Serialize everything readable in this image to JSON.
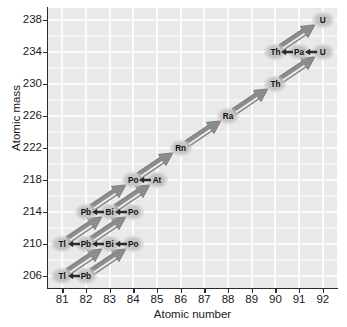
{
  "chart_data": {
    "type": "scatter",
    "title": "",
    "xlabel": "Atomic number",
    "ylabel": "Atomic mass",
    "xlim": [
      80.4,
      92.6
    ],
    "ylim": [
      204.5,
      239.5
    ],
    "xticks": [
      81,
      82,
      83,
      84,
      85,
      86,
      87,
      88,
      89,
      90,
      91,
      92
    ],
    "yticks": [
      206,
      210,
      214,
      218,
      222,
      226,
      230,
      234,
      238
    ],
    "grid": true,
    "legend": "none",
    "nodes": [
      {
        "label": "U",
        "z": 92,
        "a": 238
      },
      {
        "label": "Th",
        "z": 90,
        "a": 234
      },
      {
        "label": "Pa",
        "z": 91,
        "a": 234
      },
      {
        "label": "U",
        "z": 92,
        "a": 234
      },
      {
        "label": "Th",
        "z": 90,
        "a": 230
      },
      {
        "label": "Ra",
        "z": 88,
        "a": 226
      },
      {
        "label": "Rn",
        "z": 86,
        "a": 222
      },
      {
        "label": "Po",
        "z": 84,
        "a": 218
      },
      {
        "label": "At",
        "z": 85,
        "a": 218
      },
      {
        "label": "Pb",
        "z": 82,
        "a": 214
      },
      {
        "label": "Bi",
        "z": 83,
        "a": 214
      },
      {
        "label": "Po",
        "z": 84,
        "a": 214
      },
      {
        "label": "Tl",
        "z": 81,
        "a": 210
      },
      {
        "label": "Pb",
        "z": 82,
        "a": 210
      },
      {
        "label": "Bi",
        "z": 83,
        "a": 210
      },
      {
        "label": "Po",
        "z": 84,
        "a": 210
      },
      {
        "label": "Tl",
        "z": 81,
        "a": 206
      },
      {
        "label": "Pb",
        "z": 82,
        "a": 206
      }
    ],
    "alpha_decays": [
      {
        "from_z": 92,
        "from_a": 238,
        "to_z": 90,
        "to_a": 234
      },
      {
        "from_z": 92,
        "from_a": 234,
        "to_z": 90,
        "to_a": 230
      },
      {
        "from_z": 90,
        "from_a": 230,
        "to_z": 88,
        "to_a": 226
      },
      {
        "from_z": 88,
        "from_a": 226,
        "to_z": 86,
        "to_a": 222
      },
      {
        "from_z": 86,
        "from_a": 222,
        "to_z": 84,
        "to_a": 218
      },
      {
        "from_z": 84,
        "from_a": 218,
        "to_z": 82,
        "to_a": 214
      },
      {
        "from_z": 85,
        "from_a": 218,
        "to_z": 83,
        "to_a": 214
      },
      {
        "from_z": 84,
        "from_a": 214,
        "to_z": 82,
        "to_a": 210
      },
      {
        "from_z": 83,
        "from_a": 214,
        "to_z": 81,
        "to_a": 210
      },
      {
        "from_z": 84,
        "from_a": 210,
        "to_z": 82,
        "to_a": 206
      },
      {
        "from_z": 83,
        "from_a": 210,
        "to_z": 81,
        "to_a": 206
      }
    ],
    "beta_decays": [
      {
        "from_z": 91,
        "from_a": 234,
        "to_z": 90,
        "to_a": 234
      },
      {
        "from_z": 92,
        "from_a": 234,
        "to_z": 91,
        "to_a": 234
      },
      {
        "from_z": 85,
        "from_a": 218,
        "to_z": 84,
        "to_a": 218
      },
      {
        "from_z": 83,
        "from_a": 214,
        "to_z": 82,
        "to_a": 214
      },
      {
        "from_z": 84,
        "from_a": 214,
        "to_z": 83,
        "to_a": 214
      },
      {
        "from_z": 82,
        "from_a": 210,
        "to_z": 81,
        "to_a": 210
      },
      {
        "from_z": 83,
        "from_a": 210,
        "to_z": 82,
        "to_a": 210
      },
      {
        "from_z": 84,
        "from_a": 210,
        "to_z": 83,
        "to_a": 210
      },
      {
        "from_z": 82,
        "from_a": 206,
        "to_z": 81,
        "to_a": 206
      }
    ],
    "colors": {
      "plot_background": "#e9e9e9",
      "gridline": "#fbfbfb",
      "axis": "#2b2b2b",
      "alpha_arrow": "#8c8c8c",
      "alpha_arrow_highlight": "#f2f2f2",
      "beta_arrow": "#2b2b2b",
      "label_text": "#101010",
      "label_halo": "#b5b5b5",
      "page_background": "#ffffff"
    }
  }
}
